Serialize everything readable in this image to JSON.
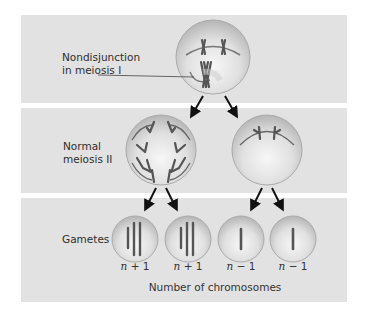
{
  "figure": {
    "rows": [
      {
        "id": "meiosis1",
        "label_line1": "Nondisjunction",
        "label_line2": "in meiosis I"
      },
      {
        "id": "meiosis2",
        "label_line1": "Normal",
        "label_line2": "meiosis II"
      },
      {
        "id": "gametes",
        "label_line1": "Gametes"
      }
    ],
    "gamete_counts": [
      "n + 1",
      "n + 1",
      "n − 1",
      "n − 1"
    ],
    "gamete_count_parts": [
      {
        "n": "n",
        "rest": " + 1"
      },
      {
        "n": "n",
        "rest": " + 1"
      },
      {
        "n": "n",
        "rest": " − 1"
      },
      {
        "n": "n",
        "rest": " − 1"
      }
    ],
    "axis_caption": "Number of chromosomes",
    "colors": {
      "panel_bg": "#e2e2e2",
      "cell_fill": "#d6d6d6",
      "chromosome": "#5a5a5a",
      "arrow": "#111111"
    }
  }
}
